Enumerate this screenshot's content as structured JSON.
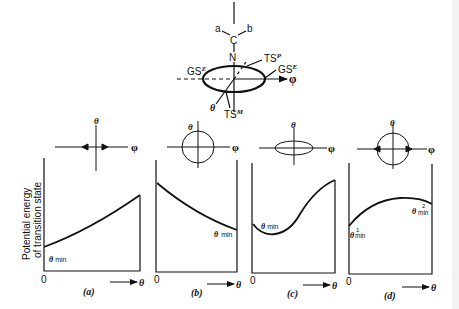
{
  "figure": {
    "molecule": {
      "substituent_a": "a",
      "substituent_b": "b",
      "carbon": "C",
      "nitrogen": "N",
      "ts_p": "TS",
      "ts_p_sup": "P",
      "ts_m": "TS",
      "ts_m_sup": "M",
      "gs_z": "GS",
      "gs_z_sup": "Z",
      "gs_e": "GS",
      "gs_e_sup": "E",
      "phi_axis": "φ",
      "theta_axis": "θ"
    },
    "y_axis_label_line1": "Potential energy",
    "y_axis_label_line2": "of transition state",
    "panels": [
      {
        "id": "a",
        "caption": "(a)",
        "origin": "0",
        "x_axis": "θ",
        "icon_theta": "θ",
        "icon_phi": "φ",
        "icon_shape": "cross-with-inward-arrows",
        "min_label": "θ",
        "min_sub": "min",
        "curve": "increasing"
      },
      {
        "id": "b",
        "caption": "(b)",
        "origin": "0",
        "x_axis": "θ",
        "icon_theta": "θ",
        "icon_phi": "φ",
        "icon_shape": "circle",
        "min_label": "θ",
        "min_sub": "min",
        "curve": "decreasing"
      },
      {
        "id": "c",
        "caption": "(c)",
        "origin": "0",
        "x_axis": "θ",
        "icon_theta": "θ",
        "icon_phi": "φ",
        "icon_shape": "flattened-ellipse",
        "min_label": "θ",
        "min_sub": "min",
        "curve": "dip-then-rise"
      },
      {
        "id": "d",
        "caption": "(d)",
        "origin": "0",
        "x_axis": "θ",
        "icon_theta": "θ",
        "icon_phi": "φ",
        "icon_shape": "circle-with-outward-arrows",
        "min_label_1": "θ",
        "min_sup_1": "1",
        "min_sub_1": "min",
        "min_label_2": "θ",
        "min_sup_2": "2",
        "min_sub_2": "min",
        "curve": "rise-then-fall"
      }
    ]
  }
}
